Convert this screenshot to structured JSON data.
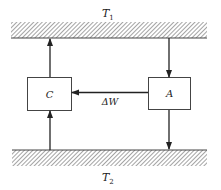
{
  "diagram": {
    "type": "heat-engine-schematic",
    "reservoirs": {
      "hot": {
        "label": "T",
        "subscript": "1"
      },
      "cold": {
        "label": "T",
        "subscript": "2"
      }
    },
    "boxes": {
      "left": {
        "label": "C"
      },
      "right": {
        "label": "A"
      }
    },
    "work_arrow": {
      "label": "ΔW",
      "direction": "A to C"
    },
    "flows": [
      {
        "from": "C",
        "to": "T1",
        "direction": "up"
      },
      {
        "from": "T1",
        "to": "A",
        "direction": "down"
      },
      {
        "from": "T2",
        "to": "C",
        "direction": "up"
      },
      {
        "from": "A",
        "to": "T2",
        "direction": "down"
      }
    ],
    "colors": {
      "line": "#222222",
      "hatch": "#555555",
      "box_border": "#444444"
    }
  }
}
